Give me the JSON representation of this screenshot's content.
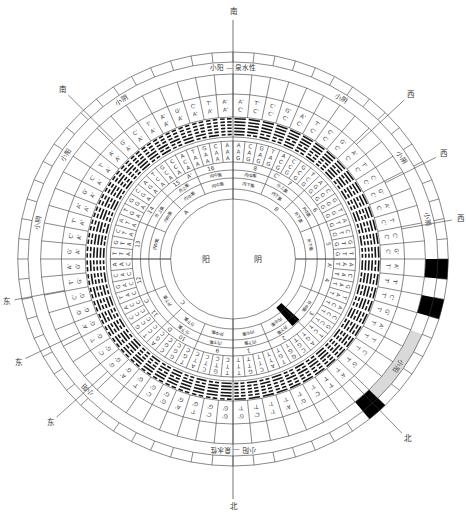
{
  "diagram": {
    "center": {
      "yang": "阳",
      "yin": "阴"
    },
    "colors": {
      "line": "#3a3a3a",
      "black_cell": "#000000",
      "gray_band": "#d9d9d9"
    },
    "directions": [
      {
        "label": "南",
        "angle": 0,
        "r": 248
      },
      {
        "label": "西",
        "angle": 46,
        "r": 237
      },
      {
        "label": "西",
        "angle": 62.5,
        "r": 228
      },
      {
        "label": "西",
        "angle": 79.5,
        "r": 222
      },
      {
        "label": "北",
        "angle": 137,
        "r": 246
      },
      {
        "label": "北",
        "angle": 180,
        "r": 247
      },
      {
        "label": "东",
        "angle": 227,
        "r": 240
      },
      {
        "label": "东",
        "angle": 243.5,
        "r": 231
      },
      {
        "label": "东",
        "angle": 259,
        "r": 222
      },
      {
        "label": "南",
        "angle": 316,
        "r": 236
      }
    ],
    "band_labels": [
      {
        "text": "小阳 — 泉水性",
        "angle": 0
      },
      {
        "text": "小阴",
        "angle": 33
      },
      {
        "text": "小阴",
        "angle": 58
      },
      {
        "text": "小阴",
        "angle": 78
      },
      {
        "text": "小阳",
        "angle": 124
      },
      {
        "text": "小阳 — 泉水性",
        "angle": 180
      },
      {
        "text": "小阳",
        "angle": 227
      },
      {
        "text": "小阴",
        "angle": 281
      },
      {
        "text": "小阳",
        "angle": 303
      },
      {
        "text": "小阴",
        "angle": 326
      }
    ],
    "highlights": {
      "gray_band": {
        "start": 112.5,
        "end": 135,
        "label": "小阳"
      },
      "black_outer_cells": [
        16,
        18,
        24
      ],
      "black_inner_bar": {
        "start": 133.5,
        "end": 139.5
      }
    },
    "letter_ring": {
      "outer": [
        "A'",
        "T'",
        "C'",
        "G'",
        "A'",
        "T'",
        "C'",
        "G'",
        "A'",
        "T'",
        "C'",
        "G'",
        "A'",
        "T'",
        "C'",
        "G'",
        "A'",
        "T'",
        "C'",
        "G'",
        "A'",
        "T'",
        "C'",
        "G'",
        "A'",
        "T'",
        "C'",
        "G'",
        "A'",
        "T'",
        "C'",
        "G'",
        "G'",
        "C'",
        "T'",
        "A'",
        "G'",
        "C'",
        "T'",
        "A'",
        "G'",
        "C'",
        "T'",
        "A'",
        "G'",
        "C'",
        "T'",
        "A'",
        "G'",
        "C'",
        "T'",
        "A'",
        "G'",
        "C'",
        "T'",
        "A'",
        "G'",
        "C'",
        "T'",
        "A'",
        "G'",
        "C'",
        "T'",
        "A'"
      ],
      "inner": [
        "C'",
        "C'",
        "C'",
        "C'",
        "C'",
        "C'",
        "C'",
        "C'",
        "C'",
        "C'",
        "C'",
        "C'",
        "C'",
        "C'",
        "C'",
        "C'",
        "T'",
        "T'",
        "T'",
        "T'",
        "T'",
        "T'",
        "T'",
        "T'",
        "T'",
        "T'",
        "T'",
        "T'",
        "T'",
        "T'",
        "T'",
        "T'",
        "G'",
        "G'",
        "G'",
        "G'",
        "G'",
        "G'",
        "G'",
        "G'",
        "G'",
        "G'",
        "G'",
        "G'",
        "G'",
        "G'",
        "G'",
        "G'",
        "A'",
        "A'",
        "A'",
        "A'",
        "A'",
        "A'",
        "A'",
        "A'",
        "A'",
        "A'",
        "A'",
        "A'",
        "A'",
        "A'",
        "A'",
        "A'"
      ]
    },
    "hexagrams": [
      63,
      62,
      61,
      60,
      59,
      58,
      57,
      56,
      55,
      54,
      53,
      52,
      51,
      50,
      49,
      48,
      47,
      46,
      45,
      44,
      43,
      42,
      41,
      40,
      39,
      38,
      37,
      36,
      35,
      34,
      33,
      32,
      31,
      30,
      29,
      28,
      27,
      26,
      25,
      24,
      23,
      22,
      21,
      20,
      19,
      18,
      17,
      16,
      15,
      14,
      13,
      12,
      11,
      10,
      9,
      8,
      7,
      6,
      5,
      4,
      3,
      2,
      1,
      0
    ],
    "codons": [
      "AAG",
      "CAG",
      "GAG",
      "TAG",
      "ACG",
      "CCG",
      "GCG",
      "TCG",
      "AGG",
      "CGG",
      "GGG",
      "TGG",
      "ATG",
      "CTG",
      "GTG",
      "TTG",
      "AAT",
      "CAT",
      "GAT",
      "TAT",
      "ACT",
      "CCT",
      "GCT",
      "TCT",
      "AGT",
      "CGT",
      "GGT",
      "TGT",
      "ATT",
      "CTT",
      "GTT",
      "TTT",
      "TTC",
      "GTC",
      "CTC",
      "ATC",
      "TGC",
      "GGC",
      "CGC",
      "AGC",
      "TCC",
      "GCC",
      "CCC",
      "ACC",
      "TAC",
      "GAC",
      "CAC",
      "AAC",
      "TTA",
      "GTA",
      "CTA",
      "ATA",
      "TGA",
      "GGA",
      "CGA",
      "AGA",
      "TCA",
      "GCA",
      "CCA",
      "ACA",
      "TAA",
      "GAA",
      "CAA",
      "AAA"
    ],
    "segments": {
      "numbers": [
        "8",
        "7",
        "6",
        "5",
        "4",
        "3",
        "2",
        "1",
        "9",
        "10",
        "11",
        "12",
        "13",
        "14",
        "15",
        "16"
      ],
      "letters": [
        "",
        "C'",
        "",
        "",
        "A'",
        "",
        "",
        "",
        "",
        "D",
        "C",
        "",
        "",
        "",
        "A'",
        ""
      ],
      "outer_labels": [
        "内中集",
        "外上集",
        "外中集",
        "",
        "",
        "外中集",
        "外下集",
        "内下集",
        "内下集",
        "外下集",
        "",
        "",
        "",
        "外上集",
        "外上集",
        "内中集"
      ],
      "inner_labels": [
        "内下集",
        "内下集",
        "外下集",
        "外下集",
        "",
        "",
        "内中集",
        "内中集",
        "外中集",
        "外下集",
        "外下集",
        "",
        "内中集",
        "内中集",
        "内中集",
        "内中集"
      ]
    },
    "inner_markers": [
      {
        "label": "B",
        "angle": 40
      },
      {
        "label": "C",
        "angle": 228
      },
      {
        "label": "A",
        "angle": 316
      }
    ]
  }
}
